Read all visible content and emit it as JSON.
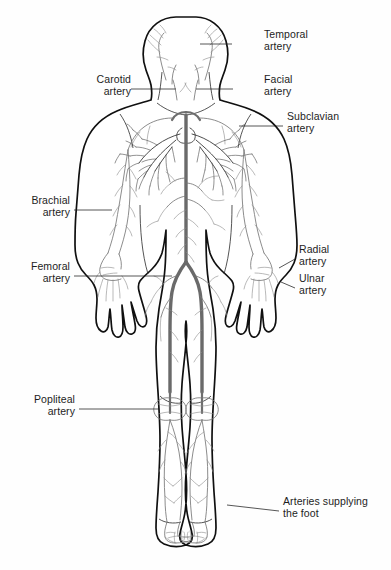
{
  "figure": {
    "background_color": "#fefefe",
    "outline_color": "#101010",
    "artery_color": "#777777",
    "aorta_color": "#6a6a6a",
    "label_color": "#1d1d1d"
  },
  "labels": [
    {
      "id": "temporal",
      "line1": "Temporal",
      "line2": "artery",
      "align": "left",
      "x": 264,
      "y": 28,
      "leader": {
        "x1": 232,
        "y1": 44,
        "x2": 200,
        "y2": 44
      }
    },
    {
      "id": "carotid",
      "line1": "Carotid",
      "line2": "artery",
      "align": "right",
      "x": 75,
      "y": 73,
      "leader": {
        "x1": 131,
        "y1": 89,
        "x2": 176,
        "y2": 89
      }
    },
    {
      "id": "facial",
      "line1": "Facial",
      "line2": "artery",
      "align": "left",
      "x": 264,
      "y": 73,
      "leader": {
        "x1": 233,
        "y1": 89,
        "x2": 196,
        "y2": 89
      }
    },
    {
      "id": "subclavian",
      "line1": "Subclavian",
      "line2": "artery",
      "align": "left",
      "x": 287,
      "y": 110,
      "leader": {
        "x1": 283,
        "y1": 126,
        "x2": 239,
        "y2": 126
      }
    },
    {
      "id": "brachial",
      "line1": "Brachial",
      "line2": "artery",
      "align": "right",
      "x": 70,
      "y": 194,
      "leader": {
        "x1": 74,
        "y1": 210,
        "x2": 112,
        "y2": 210
      }
    },
    {
      "id": "radial",
      "line1": "Radial",
      "line2": "artery",
      "align": "left",
      "x": 299,
      "y": 243,
      "leader": {
        "x1": 295,
        "y1": 259,
        "x2": 279,
        "y2": 268
      }
    },
    {
      "id": "ulnar",
      "line1": "Ulnar",
      "line2": "artery",
      "align": "left",
      "x": 299,
      "y": 272,
      "leader": {
        "x1": 295,
        "y1": 288,
        "x2": 281,
        "y2": 282
      }
    },
    {
      "id": "femoral",
      "line1": "Femoral",
      "line2": "artery",
      "align": "right",
      "x": 70,
      "y": 260,
      "leader": {
        "x1": 74,
        "y1": 276,
        "x2": 172,
        "y2": 276
      }
    },
    {
      "id": "popliteal",
      "line1": "Popliteal",
      "line2": "artery",
      "align": "right",
      "x": 75,
      "y": 393,
      "leader": {
        "x1": 79,
        "y1": 409,
        "x2": 159,
        "y2": 409
      }
    },
    {
      "id": "foot",
      "line1": "Arteries supplying",
      "line2": "the foot",
      "align": "left",
      "x": 283,
      "y": 495,
      "leader": {
        "x1": 279,
        "y1": 511,
        "x2": 227,
        "y2": 505
      }
    }
  ]
}
